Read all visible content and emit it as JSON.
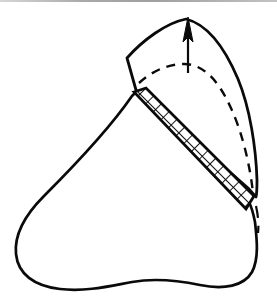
{
  "figure": {
    "title": "Rotational flap advancement diagram",
    "background_color": "#ffffff",
    "ink_color": "#0a0a0a",
    "width": 277,
    "height": 307,
    "caption": ""
  },
  "elements": {
    "body": {
      "name": "rounded-triangular-body",
      "description": "Large rounded triangular outline occupying lower left, apex at upper right",
      "apex": "132,94",
      "stroke_color": "#0a0a0a",
      "fill_color": "#ffffff"
    },
    "flap": {
      "name": "curved-wedge-flap",
      "description": "Curved wedge shaped flap raised above the body, open left corner",
      "left_corner": "127,58",
      "apex_top": "189,19",
      "tip_bottom": "256,196",
      "stroke_color": "#0a0a0a",
      "fill_color": "#ffffff"
    },
    "hatched_band": {
      "name": "crosshatched-band",
      "description": "Diagonal cross-hatched (diamond lattice) band running from upper left to lower right",
      "start": "134,93",
      "end": "252,201",
      "pattern": "cross-hatch-diamond",
      "stroke_color": "#0a0a0a",
      "fill_color": "#ffffff"
    },
    "arrow": {
      "name": "direction-arrow",
      "description": "Solid narrow arrow pointing upward inside the flap",
      "tail": "188,72",
      "tip": "188,18",
      "direction": "up",
      "color": "#0a0a0a"
    },
    "dashed_arc": {
      "name": "dashed-motion-arc",
      "description": "Dashed curve tracing original flap position from left to lower right tip",
      "start": "139,82",
      "end": "253,198",
      "style": "dashed",
      "color": "#0a0a0a"
    },
    "dashed_tail": {
      "name": "dashed-edge-continuation",
      "description": "Short dashed segment continuing below the band end along body edge",
      "start": "255,205",
      "end": "258,232",
      "style": "dashed",
      "color": "#0a0a0a"
    },
    "scan_artifact": {
      "name": "top-scan-line",
      "description": "Faint gray horizontal scan line across top edge",
      "color": "#9a9a9a"
    }
  },
  "labels": []
}
